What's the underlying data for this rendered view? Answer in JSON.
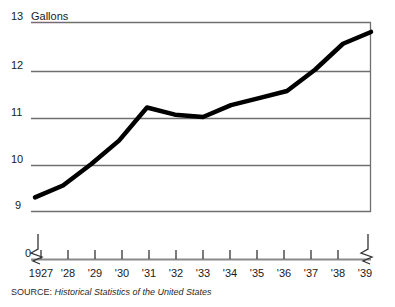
{
  "chart_data": {
    "type": "line",
    "title": "",
    "subtitle": "",
    "xlabel": "",
    "ylabel": "Gallons",
    "ylim": [
      9,
      13
    ],
    "xlim": [
      1927,
      1939
    ],
    "grid": true,
    "legend": false,
    "y_axis_break": true,
    "y_break_label": "0",
    "x_axis_break_left": true,
    "x_axis_break_right": true,
    "yticks": [
      13,
      12,
      11,
      10,
      9
    ],
    "ytick_labels": [
      "13",
      "12",
      "11",
      "10",
      "9"
    ],
    "categories": [
      1927,
      1928,
      1929,
      1930,
      1931,
      1932,
      1933,
      1934,
      1935,
      1936,
      1937,
      1938,
      1939
    ],
    "xtick_labels": [
      "1927",
      "'28",
      "'29",
      "'30",
      "'31",
      "'32",
      "'33",
      "'34",
      "'35",
      "'36",
      "'37",
      "'38",
      "'39"
    ],
    "series": [
      {
        "name": "Gallons",
        "values": [
          9.3,
          9.55,
          10.0,
          10.5,
          11.2,
          11.05,
          11.0,
          11.25,
          11.4,
          11.55,
          12.0,
          12.55,
          12.8
        ]
      }
    ],
    "line_color": "#000000",
    "line_width": 4.5,
    "gridline_color": "#7a7a7a",
    "axis_color": "#7a7a7a"
  },
  "source": {
    "prefix": "SOURCE:",
    "title": "Historical Statistics of the United States"
  }
}
